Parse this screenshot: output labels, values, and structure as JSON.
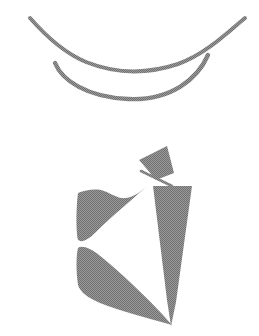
{
  "page": {
    "background_color": "#ffffff",
    "width": 259,
    "height": 336,
    "caption": "",
    "ink_color": "#8a8a8a",
    "ink_color_dark": "#7b7b7b"
  },
  "figures": [
    {
      "id": "upper-lens-figure",
      "name": "upper-lens-outline",
      "label": "Lens shape formed by two crossing curved strokes",
      "description": "Open curve with upswept tips at both ends crossing a lower bowl curve, enclosing a pointed-oval (vesica) void",
      "bbox": {
        "x": 28,
        "y": 16,
        "width": 220,
        "height": 88
      },
      "stroke_color": "#8a8a8a",
      "stroke_width": 4.2,
      "parts": [
        {
          "name": "upper-arc-stroke",
          "path": "M 30 18 C 44 34 62 52 86 62 C 116 74 148 74 178 64 C 204 55 226 34 245 18",
          "stroke_width": 4.0
        },
        {
          "name": "lower-bowl-stroke",
          "path": "M 55 63 C 62 80 86 97 128 99 C 172 101 198 78 208 55",
          "stroke_width": 4.4
        },
        {
          "name": "left-crossing-point",
          "cx": 55,
          "cy": 64
        },
        {
          "name": "right-crossing-point",
          "cx": 208,
          "cy": 55
        }
      ]
    },
    {
      "id": "lower-solid-figure",
      "name": "lower-solid-silhouette",
      "label": "Solid gray abstract silhouette",
      "description": "Angular filled figure: a small flag/pennant at upper right joined by a thin stem to a curved left wing, beside a narrow downward tapering triangle",
      "bbox": {
        "x": 76,
        "y": 146,
        "width": 118,
        "height": 182
      },
      "fill_color": "#8a8a8a",
      "parts": [
        {
          "name": "pennant-flag-shape",
          "label": "Small triangular flag at top",
          "path": "M 139 160 L 167 146 L 174 173 L 156 180 L 146 168 Z"
        },
        {
          "name": "flag-stem-stroke",
          "label": "Thin diagonal stem connecting flag to wing",
          "path": "M 141 171 L 172 186",
          "stroke_width": 2.6
        },
        {
          "name": "left-wing-shape",
          "label": "Curved left wing tapering to a waist then flaring down",
          "path": "M 78 193 C 86 190 96 188 104 191 C 112 194 118 199 126 198 C 134 197 140 192 147 186 C 132 200 112 216 96 232 C 88 240 82 243 78 240 C 76 232 76 208 78 193 Z"
        },
        {
          "name": "left-lower-blade-shape",
          "label": "Large lower-left blade sweeping diagonally to bottom right",
          "path": "M 78 248 C 82 245 90 248 99 255 C 118 270 148 298 172 325 C 146 318 118 310 100 303 C 88 298 80 292 78 285 C 76 272 76 256 78 248 Z"
        },
        {
          "name": "right-triangle-shape",
          "label": "Narrow downward pointing triangle on the right",
          "path": "M 153 186 L 192 186 L 176 302 L 171 326 L 167 300 Z"
        },
        {
          "name": "waist-notch",
          "label": "Pinch between upper wing and lower blade",
          "cx": 79,
          "cy": 244
        }
      ]
    }
  ],
  "texture": {
    "name": "halftone-dither",
    "label": "Dithered halftone scan texture",
    "dot_color": "#6f6f6f",
    "dot_spacing": 2
  }
}
